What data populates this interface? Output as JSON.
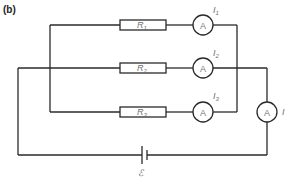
{
  "panel_label": "(b)",
  "resistors": [
    {
      "label": "R",
      "sub": "1"
    },
    {
      "label": "R",
      "sub": "2"
    },
    {
      "label": "R",
      "sub": "3"
    }
  ],
  "ammeters": [
    {
      "symbol": "A",
      "current_label": "I",
      "current_sub": "1"
    },
    {
      "symbol": "A",
      "current_label": "I",
      "current_sub": "2"
    },
    {
      "symbol": "A",
      "current_label": "I",
      "current_sub": "3"
    },
    {
      "symbol": "A",
      "current_label": "I",
      "current_sub": ""
    }
  ],
  "battery": {
    "label": "ℰ"
  },
  "colors": {
    "wire": "#2a2a2a",
    "label": "#6e6e6e",
    "background": "#ffffff"
  }
}
